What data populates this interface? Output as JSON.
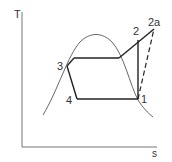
{
  "diagram": {
    "axes": {
      "y_label": "T",
      "x_label": "s"
    },
    "points": [
      {
        "id": "p1",
        "label": "1"
      },
      {
        "id": "p2",
        "label": "2"
      },
      {
        "id": "p2a",
        "label": "2a"
      },
      {
        "id": "p3",
        "label": "3"
      },
      {
        "id": "p4",
        "label": "4"
      }
    ],
    "colors": {
      "line": "#222222",
      "dome": "#555555",
      "axis": "#777777"
    }
  }
}
